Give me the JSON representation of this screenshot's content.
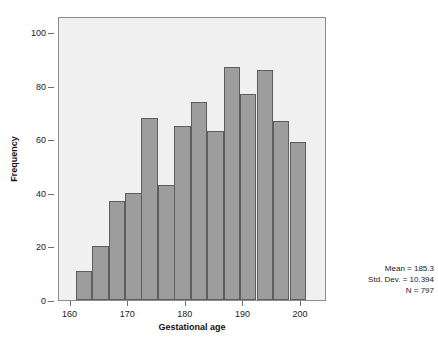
{
  "chart_data": {
    "type": "bar",
    "title": "",
    "subtitle": "",
    "xlabel": "Gestational age",
    "ylabel": "Frequency",
    "grid": false,
    "legend": "none",
    "xlim": [
      158.0,
      204.5
    ],
    "ylim": [
      0,
      106
    ],
    "xticks": [
      160,
      170,
      180,
      190,
      200
    ],
    "yticks": [
      0,
      20,
      40,
      60,
      80,
      100
    ],
    "bin_width": 2.86,
    "bin_starts": [
      160.9,
      163.8,
      166.6,
      169.5,
      172.3,
      175.2,
      178.0,
      180.9,
      183.7,
      186.6,
      189.4,
      192.3,
      195.1,
      198.0,
      200.8
    ],
    "bin_centers": [
      162.3,
      165.2,
      168.0,
      170.9,
      173.7,
      176.6,
      179.4,
      182.3,
      185.1,
      188.0,
      190.8,
      193.7,
      196.5,
      199.4,
      202.2
    ],
    "categories": [
      "160.9-163.8",
      "163.8-166.6",
      "166.6-169.5",
      "169.5-172.3",
      "172.3-175.2",
      "175.2-178.0",
      "178.0-180.9",
      "180.9-183.7",
      "183.7-186.6",
      "186.6-189.4",
      "189.4-192.3",
      "192.3-195.1",
      "195.1-198.0",
      "198.0-200.8",
      "200.8-203.7"
    ],
    "values": [
      11,
      20,
      37,
      40,
      68,
      43,
      65,
      74,
      63,
      87,
      77,
      86,
      67,
      59,
      0
    ],
    "bar_color": "#9d9d9d",
    "bar_edge_color": "#5e5e5e",
    "plot_background": "#f0f0f0",
    "figure_background": "#ffffff",
    "annotations": {
      "mean": "Mean = 185.3",
      "std_dev": "Std. Dev. = 10.394",
      "n": "N = 797"
    }
  },
  "axes": {
    "y": {
      "title": "Frequency",
      "ticks": [
        "0",
        "20",
        "40",
        "60",
        "80",
        "100"
      ]
    },
    "x": {
      "title": "Gestational age",
      "ticks": [
        "160",
        "170",
        "180",
        "190",
        "200"
      ]
    }
  },
  "stats": {
    "line1": "Mean = 185.3",
    "line2": "Std. Dev. = 10.394",
    "line3": "N = 797"
  }
}
